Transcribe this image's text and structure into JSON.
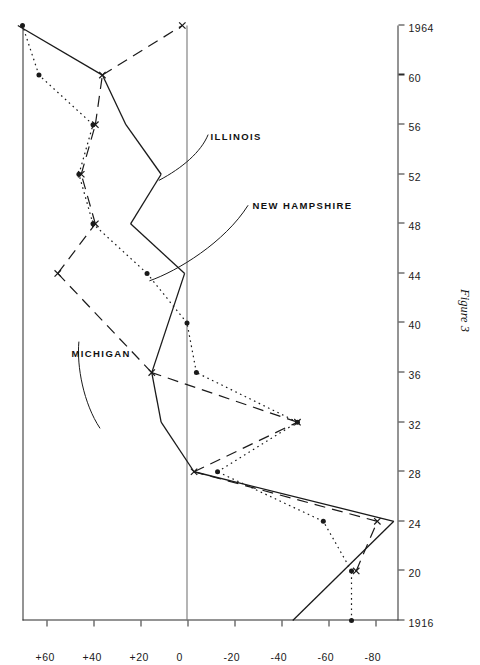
{
  "figure": {
    "caption": "Figure 3",
    "orientation": "rotated-90-ccw"
  },
  "series_labels": [
    {
      "key": "michigan",
      "text": "MICHIGAN"
    },
    {
      "key": "illinois",
      "text": "ILLINOIS"
    },
    {
      "key": "new_hampshire",
      "text": "NEW HAMPSHIRE"
    }
  ],
  "chart_data": {
    "type": "line",
    "title": "Figure 3",
    "xlabel": "",
    "ylabel": "",
    "xlim": [
      1916,
      1964
    ],
    "ylim": [
      -90,
      70
    ],
    "grid": false,
    "legend": "inline-annotations",
    "x": [
      1916,
      1920,
      1924,
      1928,
      1932,
      1936,
      1940,
      1944,
      1948,
      1952,
      1956,
      1960,
      1964
    ],
    "xtick_labels": [
      "1916",
      "20",
      "24",
      "28",
      "32",
      "36",
      "40",
      "44",
      "48",
      "52",
      "56",
      "60",
      "1964"
    ],
    "ytick_values": [
      60,
      40,
      20,
      0,
      -20,
      -40,
      -60,
      -80
    ],
    "ytick_labels": [
      "+60",
      "+40",
      "+20",
      "0",
      "-20",
      "-40",
      "-60",
      "-80"
    ],
    "series": [
      {
        "name": "MICHIGAN",
        "style": "dashed",
        "marker": "cross",
        "color": "#1a1a1a",
        "values": [
          null,
          -72,
          -81,
          -3,
          -47,
          15,
          null,
          55,
          39,
          45,
          39,
          36,
          2
        ]
      },
      {
        "name": "ILLINOIS",
        "style": "solid",
        "marker": "none",
        "color": "#1a1a1a",
        "values": [
          -45,
          null,
          -88,
          -3,
          11,
          15,
          null,
          1,
          24,
          11,
          26,
          36,
          72
        ]
      },
      {
        "name": "NEW HAMPSHIRE",
        "style": "dotted",
        "marker": "dot",
        "color": "#1a1a1a",
        "values": [
          -70,
          -70,
          -58,
          -13,
          -47,
          -4,
          0,
          17,
          40,
          46,
          40,
          63,
          70
        ]
      }
    ]
  }
}
